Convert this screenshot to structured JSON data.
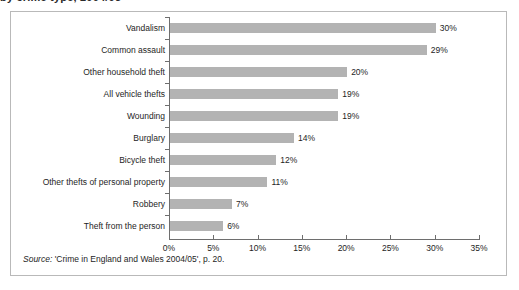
{
  "figure": {
    "caption_remnant": "by crime type, 2004/05",
    "source_prefix": "Source:",
    "source_text": " 'Crime in England and Wales 2004/05', p. 20."
  },
  "chart_data": {
    "type": "bar",
    "orientation": "horizontal",
    "title": "",
    "xlabel": "",
    "ylabel": "",
    "xlim": [
      0,
      35
    ],
    "grid": false,
    "legend": null,
    "bar_color": "#b3b3b3",
    "axis_color": "#6e6e6e",
    "value_suffix": "%",
    "xticks": [
      0,
      5,
      10,
      15,
      20,
      25,
      30,
      35
    ],
    "xtick_labels": [
      "0%",
      "5%",
      "10%",
      "15%",
      "20%",
      "25%",
      "30%",
      "35%"
    ],
    "categories": [
      "Vandalism",
      "Common assault",
      "Other household theft",
      "All vehicle thefts",
      "Wounding",
      "Burglary",
      "Bicycle theft",
      "Other thefts of personal property",
      "Robbery",
      "Theft from the person"
    ],
    "values": [
      30,
      29,
      20,
      19,
      19,
      14,
      12,
      11,
      7,
      6
    ],
    "value_labels": [
      "30%",
      "29%",
      "20%",
      "19%",
      "19%",
      "14%",
      "12%",
      "11%",
      "7%",
      "6%"
    ]
  }
}
